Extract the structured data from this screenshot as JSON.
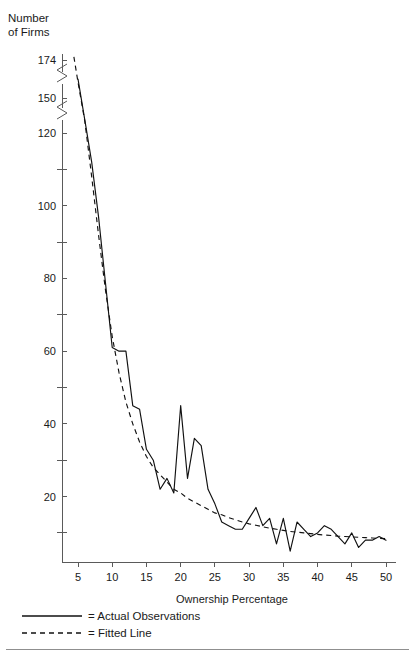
{
  "chart_data": {
    "type": "line",
    "title_line1": "Number",
    "title_line2": "of Firms",
    "xlabel": "Ownership Percentage",
    "ylabel": "Number of Firms",
    "xlim": [
      2,
      51
    ],
    "ylim": [
      2,
      174
    ],
    "grid": false,
    "legend_position": "below-axis-left",
    "axis_breaks": [
      {
        "between": [
          150,
          174
        ],
        "style": "zigzag"
      },
      {
        "between": [
          120,
          150
        ],
        "style": "zigzag"
      }
    ],
    "x_ticks_major": [
      5,
      10,
      15,
      20,
      25,
      30,
      35,
      40,
      45,
      50
    ],
    "x_tick_labels": [
      "5",
      "10",
      "15",
      "20",
      "25",
      "30",
      "35",
      "40",
      "45",
      "50"
    ],
    "y_ticks_major": [
      20,
      40,
      60,
      80,
      100,
      120,
      150,
      174
    ],
    "y_tick_labels": [
      "20",
      "40",
      "60",
      "80",
      "100",
      "120",
      "150",
      "174"
    ],
    "y_ticks_minor": [
      10,
      30,
      50,
      70,
      90,
      110
    ],
    "series": [
      {
        "name": "Actual Observations",
        "style": "solid",
        "x": [
          5,
          6,
          7,
          8,
          9,
          10,
          11,
          12,
          13,
          14,
          15,
          16,
          17,
          18,
          19,
          20,
          21,
          22,
          23,
          24,
          25,
          26,
          27,
          28,
          29,
          30,
          31,
          32,
          33,
          34,
          35,
          36,
          37,
          38,
          39,
          40,
          41,
          42,
          43,
          44,
          45,
          46,
          47,
          48,
          49,
          50
        ],
        "y": [
          162,
          131,
          112,
          97,
          79,
          61,
          60,
          60,
          45,
          44,
          33,
          30,
          22,
          25,
          21,
          45,
          25,
          36,
          34,
          22,
          18,
          13,
          12,
          11,
          11,
          14,
          17,
          12,
          14,
          7,
          14,
          5,
          13,
          11,
          9,
          10,
          12,
          11,
          9,
          7,
          10,
          6,
          8,
          8,
          9,
          8
        ]
      },
      {
        "name": "Fitted Line",
        "style": "dashed",
        "x": [
          4.4,
          5,
          6,
          7,
          8,
          9,
          10,
          11,
          12,
          13,
          14,
          15,
          16,
          17,
          18,
          19,
          20,
          21,
          22,
          23,
          24,
          25,
          26,
          27,
          28,
          29,
          30,
          31,
          32,
          33,
          34,
          35,
          36,
          37,
          38,
          39,
          40,
          41,
          42,
          43,
          44,
          45,
          46,
          47,
          48,
          49,
          50
        ],
        "y": [
          176,
          160,
          130,
          108,
          92,
          77,
          64,
          54,
          46,
          40,
          35,
          31,
          28,
          26,
          24,
          22,
          21,
          19.5,
          18.5,
          17.5,
          16.5,
          15.5,
          15,
          14.2,
          13.6,
          13,
          12.5,
          12.1,
          11.7,
          11.3,
          11,
          10.7,
          10.4,
          10.2,
          10,
          9.8,
          9.6,
          9.4,
          9.3,
          9.1,
          9,
          8.9,
          8.8,
          8.7,
          8.6,
          8.5,
          8.4
        ]
      }
    ],
    "legend": [
      {
        "swatch": "solid",
        "label": "= Actual Observations"
      },
      {
        "swatch": "dashed",
        "label": "= Fitted Line"
      }
    ]
  }
}
